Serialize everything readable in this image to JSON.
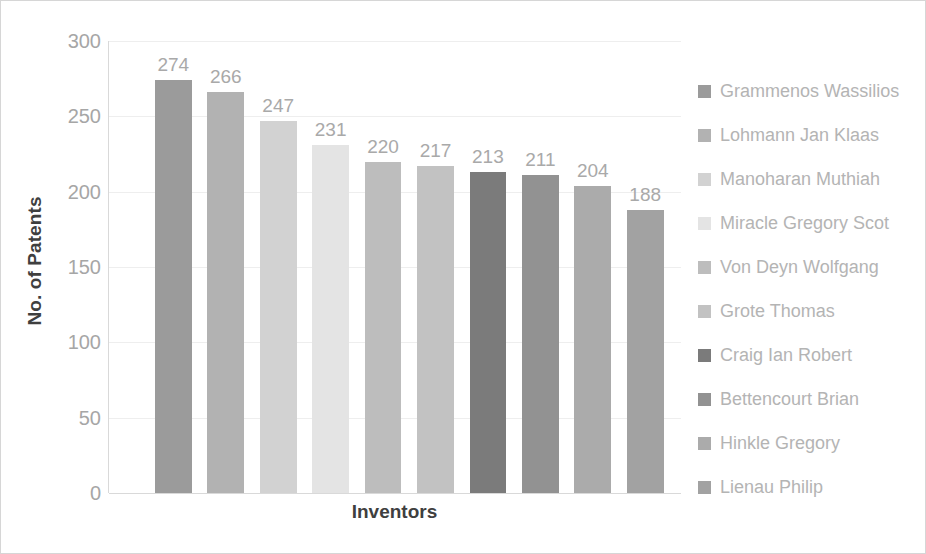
{
  "chart_data": {
    "type": "bar",
    "title": "",
    "xlabel": "Inventors",
    "ylabel": "No. of Patents",
    "ylim": [
      0,
      300
    ],
    "yticks": [
      300,
      250,
      200,
      150,
      100,
      50,
      0
    ],
    "grid": true,
    "legend_position": "right",
    "categories": [
      "Grammenos Wassilios",
      "Lohmann Jan Klaas",
      "Manoharan Muthiah",
      "Miracle Gregory Scot",
      "Von Deyn Wolfgang",
      "Grote Thomas",
      "Craig Ian Robert",
      "Bettencourt Brian",
      "Hinkle Gregory",
      "Lienau Philip"
    ],
    "values": [
      274,
      266,
      247,
      231,
      220,
      217,
      213,
      211,
      204,
      188
    ],
    "colors": [
      "#9b9b9b",
      "#b2b2b2",
      "#d2d2d2",
      "#e4e4e4",
      "#bdbdbd",
      "#c2c2c2",
      "#7b7b7b",
      "#929292",
      "#ababab",
      "#a2a2a2"
    ]
  },
  "axis": {
    "y_title": "No. of Patents",
    "x_title": "Inventors"
  }
}
